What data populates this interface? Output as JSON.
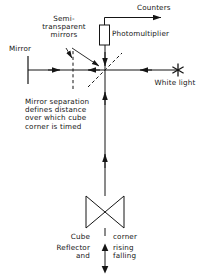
{
  "figure": {
    "type": "optical-schematic",
    "title_present": false,
    "background": "#ffffff",
    "ink": "#151515"
  },
  "labels": {
    "counters": "Counters",
    "photomultiplier": "Photomultiplier",
    "semi_transparent_mirrors": "Semi-\ntransparent\nmirrors",
    "mirror": "Mirror",
    "white_light": "White light",
    "mirror_separation_note": "Mirror separation\ndefines distance\nover which cube\ncorner is timed",
    "cube": "Cube",
    "corner": "corner",
    "reflector_and": "Reflector\nand",
    "rising_falling": "rising\nfalling"
  },
  "components": {
    "mirror_bar": "mirror",
    "semi_transparent_mirror_vertical": "dashed-vertical-mirror",
    "semi_transparent_mirror_diagonal": "dashed-diagonal-beamsplitter",
    "photomultiplier_box": "photomultiplier-detector",
    "light_source": "white-light-star",
    "cube_corner_reflector": "bowtie-cube-corner",
    "travel_arrow": "double-headed-vertical-arrow"
  },
  "icons": {
    "star": "star-icon",
    "arrow_right": "arrow-right-icon",
    "arrow_left": "arrow-left-icon",
    "arrow_down": "arrow-down-icon",
    "arrow_up": "arrow-up-icon"
  }
}
